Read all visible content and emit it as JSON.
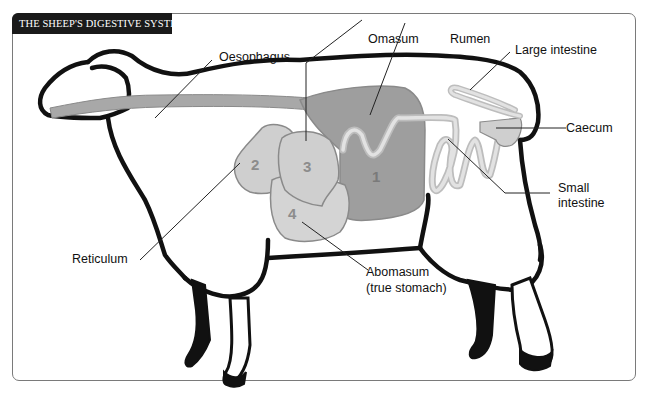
{
  "title": "THE SHEEP'S DIGESTIVE SYSTEM",
  "labels": {
    "oesophagus": "Oesophagus",
    "omasum": "Omasum",
    "rumen": "Rumen",
    "large_intestine": "Large intestine",
    "caecum": "Caecum",
    "small_intestine_1": "Small",
    "small_intestine_2": "intestine",
    "reticulum": "Reticulum",
    "abomasum_1": "Abomasum",
    "abomasum_2": "(true stomach)"
  },
  "stomach_numbers": {
    "rumen": "1",
    "reticulum": "2",
    "omasum": "3",
    "abomasum": "4"
  },
  "colors": {
    "header_bg": "#1a1a1a",
    "outline": "#111111",
    "rumen_fill": "#9e9e9e",
    "light_organ_fill": "#cfcfcf",
    "organ_stroke": "#8a8a8a",
    "number_color": "#8c8c8c",
    "frame_border": "#7a7a7a"
  }
}
